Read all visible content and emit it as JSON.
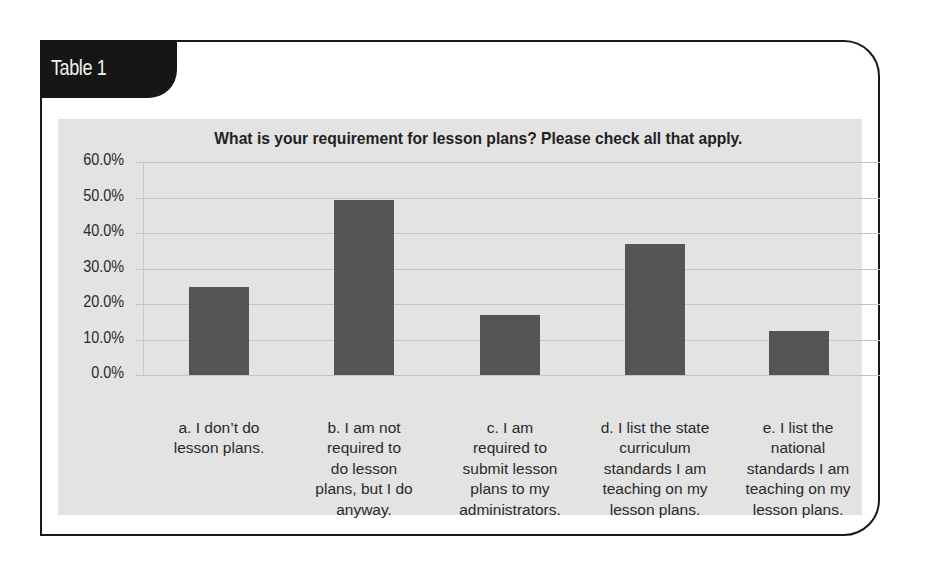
{
  "table_label": "Table 1",
  "colors": {
    "bar": "#555555",
    "chart_background": "#e3e3e3",
    "tab_background": "#161616",
    "gridline": "#c4c4c4"
  },
  "chart_data": {
    "type": "bar",
    "title": "What is your requirement for lesson plans? Please check all that apply.",
    "xlabel": "",
    "ylabel": "",
    "ylim": [
      0,
      60
    ],
    "yticks": [
      "60.0%",
      "50.0%",
      "40.0%",
      "30.0%",
      "20.0%",
      "10.0%",
      "0.0%"
    ],
    "grid": true,
    "legend": null,
    "categories": [
      "a. I don’t do lesson plans.",
      "b. I am not required to do lesson plans, but I do anyway.",
      "c. I am required to submit lesson plans to my administrators.",
      "d. I list the state curriculum standards I am teaching on my lesson plans.",
      "e. I list the national standards I am teaching on my lesson plans."
    ],
    "category_lines": [
      [
        "a. I don’t do",
        "lesson plans."
      ],
      [
        "b. I am not",
        "required to",
        "do lesson",
        "plans, but I do",
        "anyway."
      ],
      [
        "c. I am",
        "required to",
        "submit lesson",
        "plans to my",
        "administrators."
      ],
      [
        "d. I list the state",
        "curriculum",
        "standards I am",
        "teaching on my",
        "lesson plans."
      ],
      [
        "e. I list the",
        "national",
        "standards I am",
        "teaching on my",
        "lesson plans."
      ]
    ],
    "values": [
      24.8,
      49.2,
      16.9,
      37.0,
      12.4
    ],
    "unit": "%"
  }
}
